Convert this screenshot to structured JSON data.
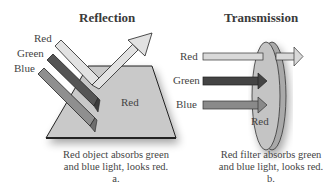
{
  "panels": {
    "reflection": {
      "title": "Reflection",
      "incoming": [
        "Red",
        "Green",
        "Blue"
      ],
      "surface_label": "Red",
      "caption_line1": "Red object absorbs green",
      "caption_line2": "and blue light, looks red.",
      "caption_letter": "a."
    },
    "transmission": {
      "title": "Transmission",
      "incoming": [
        "Red",
        "Green",
        "Blue"
      ],
      "filter_label": "Red",
      "caption_line1": "Red filter absorbs green",
      "caption_line2": "and blue light, looks red.",
      "caption_letter": "b."
    }
  },
  "colors": {
    "red_beam": "#d8d8d8",
    "green_beam": "#555555",
    "blue_beam": "#8a8a8a",
    "surface": "#c8c8c8",
    "filter": "#bdbdbd"
  }
}
